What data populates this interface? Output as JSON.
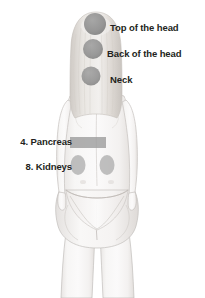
{
  "diagram": {
    "title_visible": false,
    "background_color": "#ffffff",
    "view": "posterior",
    "label_color": "#231f20",
    "marker_color": "#8a8a8a",
    "skin_color": "#f4f2f1",
    "hair_color": "#dedad6",
    "outline_color": "#b9b5b2"
  },
  "labels": {
    "top_of_the_head": "Top of the head",
    "back_of_the_head": "Back of the head",
    "neck": "Neck",
    "pancreas": "4. Pancreas",
    "kidneys": "8. Kidneys"
  },
  "markers": [
    {
      "name": "top-of-the-head-marker",
      "label": "Top of the head",
      "shape": "circle",
      "cx": 95,
      "cy": 24,
      "r": 11,
      "color": "#8a8a8a",
      "side": "right"
    },
    {
      "name": "back-of-the-head-marker",
      "label": "Back of the head",
      "shape": "circle",
      "cx": 93,
      "cy": 49,
      "r": 10,
      "color": "#8a8a8a",
      "side": "right"
    },
    {
      "name": "neck-marker",
      "label": "Neck",
      "shape": "circle",
      "cx": 91,
      "cy": 76,
      "r": 9.5,
      "color": "#8a8a8a",
      "side": "right"
    },
    {
      "name": "pancreas-marker",
      "label": "4. Pancreas",
      "shape": "rect",
      "x": 70,
      "y": 137,
      "width": 36,
      "height": 11,
      "color": "#9a9a9a",
      "side": "left"
    },
    {
      "name": "kidney-left-marker",
      "label": "8. Kidneys",
      "shape": "ellipse",
      "cx": 78,
      "cy": 165,
      "rx": 7.5,
      "ry": 10,
      "color": "#a8a8a8",
      "side": "left"
    },
    {
      "name": "kidney-right-marker",
      "label": "8. Kidneys",
      "shape": "ellipse",
      "cx": 107,
      "cy": 165,
      "rx": 7.5,
      "ry": 10,
      "color": "#a8a8a8",
      "side": "left"
    }
  ],
  "label_positions": {
    "top_of_the_head": {
      "left": 110,
      "top": 22
    },
    "back_of_the_head": {
      "left": 107,
      "top": 48
    },
    "neck": {
      "left": 110,
      "top": 74
    },
    "pancreas": {
      "right": 133,
      "top": 136
    },
    "kidneys": {
      "right": 133,
      "top": 161
    }
  }
}
